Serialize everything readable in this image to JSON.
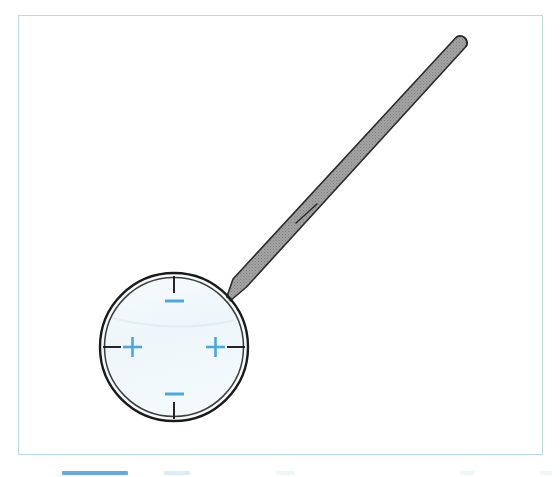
{
  "figure": {
    "panel": {
      "border_color": "#b9dae9",
      "background_color": "#ffffff",
      "x": 18,
      "y": 15,
      "width": 525,
      "height": 440
    },
    "lens": {
      "name": "lens-circle",
      "center_x": 174,
      "center_y": 347,
      "radius": 74,
      "fill_color": "#f1f8fb",
      "rim_color": "#1c1c1c",
      "rim_inner_color": "#3a3a3a",
      "rim_thickness": 5
    },
    "handle": {
      "name": "magnifier-handle",
      "fill_color": "#9b9b9b",
      "outline_color": "#2b2b2b",
      "tip_x": 460,
      "tip_y": 52,
      "base_x": 235,
      "base_y": 296,
      "segment_line_x": 307,
      "segment_line_y": 212,
      "width_at_base": 22,
      "width_at_tip": 13
    },
    "markings": {
      "tick_color": "#1a1a1a",
      "symbol_color": "#4aa8de",
      "items": [
        {
          "position": "top",
          "tick": "vertical-tick",
          "symbol": "minus",
          "symbol_label": "–"
        },
        {
          "position": "bottom",
          "tick": "vertical-tick",
          "symbol": "minus",
          "symbol_label": "–"
        },
        {
          "position": "left",
          "tick": "horizontal-tick",
          "symbol": "plus",
          "symbol_label": "+"
        },
        {
          "position": "right",
          "tick": "horizontal-tick",
          "symbol": "plus",
          "symbol_label": "+"
        }
      ]
    }
  },
  "bottom_strip": {
    "name": "cropped-footer-strip",
    "chips": [
      {
        "left": 62,
        "width": 66,
        "style": "solid"
      },
      {
        "left": 164,
        "width": 26,
        "style": "pale"
      },
      {
        "left": 276,
        "width": 18,
        "style": "ghost"
      },
      {
        "left": 460,
        "width": 14,
        "style": "ghost"
      },
      {
        "left": 540,
        "width": 12,
        "style": "ghost"
      }
    ]
  }
}
